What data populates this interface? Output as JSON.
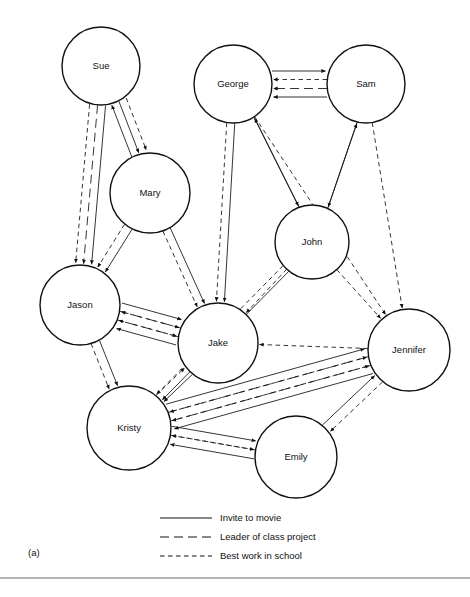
{
  "figure": {
    "panel_label": "(a)",
    "width": 470,
    "height": 597,
    "background_color": "#ffffff",
    "line_color": "#111111",
    "node_fill": "#ffffff",
    "node_radius": 40,
    "rule_color": "#6b6b6b"
  },
  "nodes": [
    {
      "id": "sue",
      "label": "Sue",
      "x": 101,
      "y": 66,
      "r": 39
    },
    {
      "id": "george",
      "label": "George",
      "x": 233,
      "y": 84,
      "r": 39
    },
    {
      "id": "sam",
      "label": "Sam",
      "x": 366,
      "y": 84,
      "r": 39
    },
    {
      "id": "mary",
      "label": "Mary",
      "x": 150,
      "y": 193,
      "r": 40
    },
    {
      "id": "john",
      "label": "John",
      "x": 312,
      "y": 242,
      "r": 37
    },
    {
      "id": "jason",
      "label": "Jason",
      "x": 80,
      "y": 305,
      "r": 40
    },
    {
      "id": "jake",
      "label": "Jake",
      "x": 218,
      "y": 343,
      "r": 40
    },
    {
      "id": "jennifer",
      "label": "Jennifer",
      "x": 409,
      "y": 350,
      "r": 41
    },
    {
      "id": "kristy",
      "label": "Kristy",
      "x": 129,
      "y": 428,
      "r": 42
    },
    {
      "id": "emily",
      "label": "Emily",
      "x": 296,
      "y": 457,
      "r": 41
    }
  ],
  "legend": {
    "items": [
      {
        "id": "invite-to-movie",
        "label": "Invite to movie",
        "style": "solid",
        "dash": "none"
      },
      {
        "id": "leader-of-class-project",
        "label": "Leader of class project",
        "style": "long-dash",
        "dash": "9,5"
      },
      {
        "id": "best-work-in-school",
        "label": "Best work in school",
        "style": "short-dash",
        "dash": "4.5,3.5"
      }
    ],
    "line_x1": 160,
    "line_x2": 212,
    "text_x": 220,
    "rows_y": [
      518,
      537,
      556
    ]
  },
  "edges": [
    {
      "source": "sam",
      "target": "george",
      "relation": "invite-to-movie",
      "offset": -13,
      "bow": 0
    },
    {
      "source": "sam",
      "target": "george",
      "relation": "leader-of-class-project",
      "offset": -4.5,
      "bow": 0
    },
    {
      "source": "sam",
      "target": "george",
      "relation": "best-work-in-school",
      "offset": 4.5,
      "bow": 0
    },
    {
      "source": "george",
      "target": "sam",
      "relation": "invite-to-movie",
      "offset": -13,
      "bow": 0
    },
    {
      "source": "sue",
      "target": "mary",
      "relation": "invite-to-movie",
      "offset": -4,
      "bow": 0
    },
    {
      "source": "sue",
      "target": "mary",
      "relation": "best-work-in-school",
      "offset": -12,
      "bow": 0
    },
    {
      "source": "mary",
      "target": "sue",
      "relation": "invite-to-movie",
      "offset": -4,
      "bow": 0
    },
    {
      "source": "sue",
      "target": "jason",
      "relation": "invite-to-movie",
      "offset": -8,
      "bow": 0
    },
    {
      "source": "sue",
      "target": "jason",
      "relation": "leader-of-class-project",
      "offset": 0,
      "bow": 0
    },
    {
      "source": "sue",
      "target": "jason",
      "relation": "best-work-in-school",
      "offset": 8,
      "bow": 0
    },
    {
      "source": "mary",
      "target": "jason",
      "relation": "invite-to-movie",
      "offset": -4,
      "bow": 0
    },
    {
      "source": "mary",
      "target": "jason",
      "relation": "best-work-in-school",
      "offset": 5,
      "bow": 0
    },
    {
      "source": "mary",
      "target": "jake",
      "relation": "invite-to-movie",
      "offset": -4,
      "bow": 0
    },
    {
      "source": "mary",
      "target": "jake",
      "relation": "best-work-in-school",
      "offset": 4,
      "bow": 0
    },
    {
      "source": "george",
      "target": "jake",
      "relation": "invite-to-movie",
      "offset": -4,
      "bow": 0
    },
    {
      "source": "george",
      "target": "jake",
      "relation": "best-work-in-school",
      "offset": 4,
      "bow": 0
    },
    {
      "source": "george",
      "target": "john",
      "relation": "invite-to-movie",
      "offset": -4,
      "bow": 0
    },
    {
      "source": "john",
      "target": "george",
      "relation": "invite-to-movie",
      "offset": 4,
      "bow": 0
    },
    {
      "source": "george",
      "target": "jennifer",
      "relation": "best-work-in-school",
      "offset": 0,
      "bow": 0
    },
    {
      "source": "sam",
      "target": "john",
      "relation": "invite-to-movie",
      "offset": -4,
      "bow": 0
    },
    {
      "source": "john",
      "target": "sam",
      "relation": "invite-to-movie",
      "offset": 4,
      "bow": 0
    },
    {
      "source": "sam",
      "target": "jennifer",
      "relation": "best-work-in-school",
      "offset": 0,
      "bow": 0
    },
    {
      "source": "john",
      "target": "jake",
      "relation": "best-work-in-school",
      "offset": 0,
      "bow": 0
    },
    {
      "source": "john",
      "target": "jennifer",
      "relation": "best-work-in-school",
      "offset": 0,
      "bow": 0
    },
    {
      "source": "john",
      "target": "kristy",
      "relation": "invite-to-movie",
      "offset": -4,
      "bow": 0
    },
    {
      "source": "john",
      "target": "kristy",
      "relation": "best-work-in-school",
      "offset": 4,
      "bow": 0
    },
    {
      "source": "jason",
      "target": "jake",
      "relation": "invite-to-movie",
      "offset": -13,
      "bow": 0
    },
    {
      "source": "jason",
      "target": "jake",
      "relation": "leader-of-class-project",
      "offset": -4.5,
      "bow": 0
    },
    {
      "source": "jason",
      "target": "jake",
      "relation": "best-work-in-school",
      "offset": 4.5,
      "bow": 0
    },
    {
      "source": "jake",
      "target": "jason",
      "relation": "invite-to-movie",
      "offset": -13,
      "bow": 0
    },
    {
      "source": "jake",
      "target": "jason",
      "relation": "leader-of-class-project",
      "offset": -4.5,
      "bow": 0
    },
    {
      "source": "jake",
      "target": "jason",
      "relation": "best-work-in-school",
      "offset": 4.5,
      "bow": 0
    },
    {
      "source": "jason",
      "target": "kristy",
      "relation": "invite-to-movie",
      "offset": -5,
      "bow": 0
    },
    {
      "source": "jason",
      "target": "kristy",
      "relation": "best-work-in-school",
      "offset": 4,
      "bow": 0
    },
    {
      "source": "jake",
      "target": "kristy",
      "relation": "invite-to-movie",
      "offset": -5,
      "bow": 0
    },
    {
      "source": "kristy",
      "target": "jake",
      "relation": "best-work-in-school",
      "offset": -5,
      "bow": 0
    },
    {
      "source": "jennifer",
      "target": "jake",
      "relation": "best-work-in-school",
      "offset": 0,
      "bow": 0
    },
    {
      "source": "jennifer",
      "target": "kristy",
      "relation": "invite-to-movie",
      "offset": -13,
      "bow": 0
    },
    {
      "source": "jennifer",
      "target": "kristy",
      "relation": "leader-of-class-project",
      "offset": -4.5,
      "bow": 0
    },
    {
      "source": "jennifer",
      "target": "kristy",
      "relation": "best-work-in-school",
      "offset": 4.5,
      "bow": 0
    },
    {
      "source": "kristy",
      "target": "jennifer",
      "relation": "invite-to-movie",
      "offset": -13,
      "bow": 0
    },
    {
      "source": "kristy",
      "target": "jennifer",
      "relation": "leader-of-class-project",
      "offset": -4.5,
      "bow": 0
    },
    {
      "source": "kristy",
      "target": "jennifer",
      "relation": "best-work-in-school",
      "offset": 4.5,
      "bow": 0
    },
    {
      "source": "kristy",
      "target": "emily",
      "relation": "invite-to-movie",
      "offset": -9,
      "bow": 0
    },
    {
      "source": "kristy",
      "target": "emily",
      "relation": "best-work-in-school",
      "offset": 0,
      "bow": 0
    },
    {
      "source": "emily",
      "target": "kristy",
      "relation": "invite-to-movie",
      "offset": -9,
      "bow": 0
    },
    {
      "source": "emily",
      "target": "kristy",
      "relation": "best-work-in-school",
      "offset": 0,
      "bow": 0
    },
    {
      "source": "emily",
      "target": "jennifer",
      "relation": "invite-to-movie",
      "offset": -5,
      "bow": 0
    },
    {
      "source": "jennifer",
      "target": "emily",
      "relation": "best-work-in-school",
      "offset": -5,
      "bow": 0
    }
  ],
  "rule": {
    "y": 578,
    "x1": 0,
    "x2": 470
  }
}
